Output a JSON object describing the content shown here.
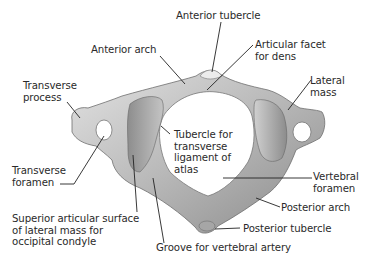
{
  "diagram": {
    "colors": {
      "background": "#ffffff",
      "bone_light": "#d9d9d9",
      "bone_mid": "#a9a9a9",
      "bone_dark": "#7a7a7a",
      "leader_line": "#222222",
      "text": "#2a2a2a"
    },
    "labels": [
      {
        "id": "anterior-tubercle",
        "text": "Anterior tubercle"
      },
      {
        "id": "anterior-arch",
        "text": "Anterior arch"
      },
      {
        "id": "articular-facet-for-dens",
        "text": "Articular facet\nfor dens"
      },
      {
        "id": "lateral-mass",
        "text": "Lateral\nmass"
      },
      {
        "id": "transverse-process",
        "text": "Transverse\nprocess"
      },
      {
        "id": "tubercle-for-transverse-ligament",
        "text": "Tubercle for\ntransverse\nligament of\natlas"
      },
      {
        "id": "transverse-foramen",
        "text": "Transverse\nforamen"
      },
      {
        "id": "vertebral-foramen",
        "text": "Vertebral\nforamen"
      },
      {
        "id": "posterior-arch",
        "text": "Posterior arch"
      },
      {
        "id": "superior-articular-surface",
        "text": "Superior articular surface\nof lateral mass for\noccipital condyle"
      },
      {
        "id": "posterior-tubercle",
        "text": "Posterior tubercle"
      },
      {
        "id": "groove-for-vertebral-artery",
        "text": "Groove for vertebral artery"
      }
    ]
  }
}
